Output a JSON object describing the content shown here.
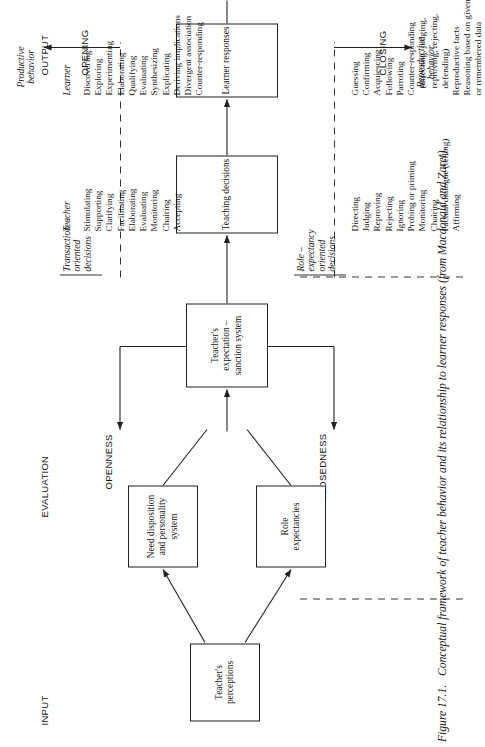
{
  "figure": {
    "number": "Figure 17.1.",
    "caption": "Conceptual framework of teacher behavior and its relationship to learner responses (from Macdonald and Zaret)."
  },
  "axis_labels": {
    "input": "INPUT",
    "evaluation": "EVALUATION",
    "output": "OUTPUT",
    "opening": "OPENING",
    "closing": "CLOSING",
    "openness": "OPENNESS",
    "closedness": "CLOSEDNESS"
  },
  "boxes": {
    "perceptions": "Teacher's\nperceptions",
    "need_disposition": "Need disposition\nand personality\nsystem",
    "role_expectancies": "Role\nexpectancies",
    "expectation_sanction": "Teacher's expectation –\nsanction system",
    "teaching_decisions": "Teaching decisions",
    "learner_responses": "Learner responses"
  },
  "group_labels": {
    "role_expectancy": "Role –\nexpectancy\noriented\ndecisions",
    "transaction": "Transaction –\noriented\ndecisions",
    "teacher": "Teacher",
    "learner": "Learner",
    "productive_behavior": "Productive\nbehavior",
    "reproductive_behavior": "Reproductive\nbehavior"
  },
  "lists": {
    "teacher_open": [
      "Stimulating",
      "Supporting",
      "Clarifying",
      "Facilitating",
      "Elaborating",
      "Evaluating",
      "Monitoring",
      "Chairing",
      "Accepting"
    ],
    "teacher_closed": [
      "Directing",
      "Judging",
      "Reproving",
      "Rejecting",
      "Ignoring",
      "Probing or priming",
      "Monitoring",
      "Chairing",
      "Factual dialogue (telling)",
      "Affirming"
    ],
    "learner_productive": [
      "Discovering",
      "Exploring",
      "Experimenting",
      "Elaborating",
      "Qualifying",
      "Evaluating",
      "Synthesizing",
      "Explicating",
      "Deriving implications",
      "Divergent association",
      "Counter-responding"
    ],
    "learner_reproductive": [
      "Guessing",
      "Confirming",
      "Acquiescing",
      "Following",
      "Parroting",
      "Counter-responding",
      "(directing, judging,",
      "reproving, rejecting,",
      "defending)",
      "Reproductive facts",
      "Reasoning based on given",
      "or remembered data"
    ]
  },
  "colors": {
    "ink": "#151515",
    "line": "#222222",
    "background": "#ffffff"
  }
}
